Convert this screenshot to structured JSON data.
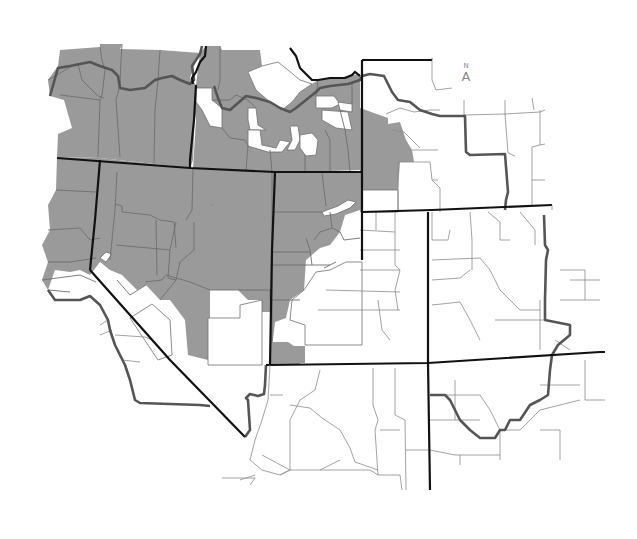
{
  "map": {
    "title": "",
    "description": "Western United States county map with shaded counties",
    "colors": {
      "background": "#ffffff",
      "shaded_county": "#9a9a9a",
      "unshaded_county": "#ffffff",
      "county_border": "#6e6e6e",
      "region_border": "#555555",
      "state_border": "#111111"
    },
    "legend": {
      "shaded": "Shaded counties",
      "unshaded": "Unshaded counties"
    },
    "north_arrow": {
      "label": "N",
      "glyph": "A"
    },
    "regions_shaded": [
      "Oregon (most)",
      "Idaho (most)",
      "Nevada (most)",
      "Utah (most)",
      "Western Montana (partial)",
      "Northern California (partial)",
      "Western Wyoming (partial)"
    ],
    "regions_unshaded": [
      "Wyoming (most)",
      "Colorado",
      "Arizona",
      "New Mexico",
      "Southern California",
      "Eastern Montana"
    ]
  }
}
